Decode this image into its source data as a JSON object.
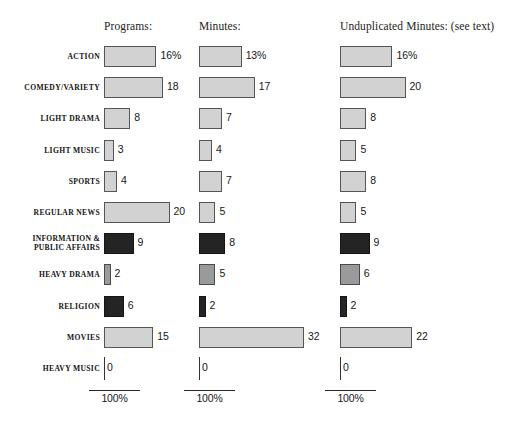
{
  "chart_data": {
    "type": "bar",
    "orientation": "horizontal",
    "title": "",
    "xlabel": "",
    "ylabel": "",
    "grid": false,
    "legend": "none",
    "scale_label": "100%",
    "scale_note": "Each column is drawn to a common 100% scale bar shown beneath it.",
    "categories": [
      "ACTION",
      "COMEDY/VARIETY",
      "LIGHT DRAMA",
      "LIGHT MUSIC",
      "SPORTS",
      "REGULAR NEWS",
      "INFORMATION &\nPUBLIC AFFAIRS",
      "HEAVY DRAMA",
      "RELIGION",
      "MOVIES",
      "HEAVY MUSIC"
    ],
    "series": [
      {
        "name": "Programs:",
        "values": [
          16,
          18,
          8,
          3,
          4,
          20,
          9,
          2,
          6,
          15,
          0
        ],
        "labels": [
          "16%",
          "18",
          "8",
          "3",
          "4",
          "20",
          "9",
          "2",
          "6",
          "15",
          "0"
        ]
      },
      {
        "name": "Minutes:",
        "values": [
          13,
          17,
          7,
          4,
          7,
          5,
          8,
          5,
          2,
          32,
          0
        ],
        "labels": [
          "13%",
          "17",
          "7",
          "4",
          "7",
          "5",
          "8",
          "5",
          "2",
          "32",
          "0"
        ]
      },
      {
        "name": "Unduplicated Minutes: (see text)",
        "values": [
          16,
          20,
          8,
          5,
          8,
          5,
          9,
          6,
          2,
          22,
          0
        ],
        "labels": [
          "16%",
          "20",
          "8",
          "5",
          "8",
          "5",
          "9",
          "6",
          "2",
          "22",
          "0"
        ]
      }
    ],
    "shading": [
      "light",
      "light",
      "light",
      "light",
      "light",
      "light",
      "dark",
      "medium",
      "dark",
      "light",
      "zero"
    ],
    "xlim": [
      0,
      100
    ]
  },
  "colors": {
    "bar_light": "#d2d2d2",
    "bar_medium": "#9a9a9a",
    "bar_dark": "#242424",
    "bar_outline": "#4a4a4a",
    "text": "#161616",
    "background": "#ffffff"
  }
}
